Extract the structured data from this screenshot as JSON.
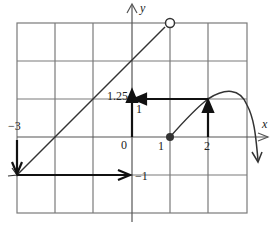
{
  "figure": {
    "type": "function-graph-with-composition-arrows",
    "axes": {
      "x_label": "x",
      "y_label": "y",
      "grid": {
        "x_min": -3,
        "x_max": 3,
        "y_min": -2,
        "y_max": 3
      }
    },
    "labels": {
      "neg3": "−3",
      "zero": "0",
      "one_x": "1",
      "two_x": "2",
      "one_y": "1",
      "one_25": "1.25",
      "neg1": "−1"
    },
    "curves": [
      {
        "name": "line-segment",
        "description": "line from (-3,-1) to open circle at (1,3)",
        "start": [
          -3,
          -1
        ],
        "end": [
          1,
          3
        ],
        "end_marker": "open-circle"
      },
      {
        "name": "curve",
        "description": "curve starting at closed dot (1,0), rising to peak near (2.3,1.3), falling steeply past x=3",
        "start": [
          1,
          0
        ],
        "start_marker": "closed-dot"
      }
    ],
    "arrows": [
      {
        "from": [
          -3,
          0
        ],
        "to": [
          -3,
          -1
        ],
        "desc": "down from x=-3 to graph"
      },
      {
        "from": [
          -3,
          -1
        ],
        "to": [
          0,
          -1
        ],
        "desc": "across to y-axis at -1"
      },
      {
        "from": [
          0,
          0
        ],
        "to": [
          0,
          1.25
        ],
        "desc": "up from 0 to 1.25"
      },
      {
        "from": [
          2,
          0
        ],
        "to": [
          2,
          1
        ],
        "desc": "up from x=2 to curve"
      },
      {
        "from": [
          2,
          1
        ],
        "to": [
          0,
          1
        ],
        "desc": "across to y-axis at 1"
      }
    ],
    "colors": {
      "grid": "#777777",
      "stroke": "#1a1a1a",
      "background": "#ffffff"
    }
  }
}
